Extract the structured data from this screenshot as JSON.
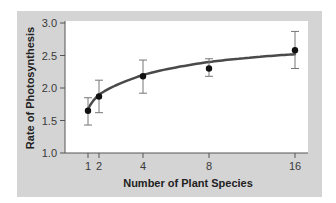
{
  "chart_data": {
    "type": "scatter",
    "title": "",
    "xlabel": "Number of Plant Species",
    "ylabel": "Rate of Photosynthesis",
    "x_ticks": [
      1,
      2,
      4,
      8,
      16
    ],
    "x_tick_labels": [
      "1",
      "2",
      "4",
      "8",
      "16"
    ],
    "y_ticks": [
      1.0,
      1.5,
      2.0,
      2.5,
      3.0
    ],
    "y_tick_labels": [
      "1.0",
      "1.5",
      "2.0",
      "2.5",
      "3.0"
    ],
    "ylim": [
      1.0,
      3.0
    ],
    "xlim": [
      0,
      17
    ],
    "grid": false,
    "legend": null,
    "series": [
      {
        "name": "Observed",
        "x": [
          1,
          2,
          4,
          8,
          16
        ],
        "y": [
          1.65,
          1.87,
          2.18,
          2.3,
          2.58
        ],
        "error_low": [
          1.43,
          1.62,
          1.92,
          2.18,
          2.3
        ],
        "error_high": [
          1.85,
          2.12,
          2.43,
          2.45,
          2.87
        ],
        "marker": "circle",
        "color": "#111111"
      },
      {
        "name": "Fitted curve",
        "type": "line",
        "x": [
          1,
          2,
          4,
          8,
          16
        ],
        "y": [
          1.68,
          1.9,
          2.2,
          2.4,
          2.52
        ],
        "color": "#4a4a4a"
      }
    ],
    "colors": {
      "panel": "#d4d4d4",
      "plot_bg": "#ffffff",
      "error_bar": "#777777",
      "axis": "#555555"
    }
  }
}
